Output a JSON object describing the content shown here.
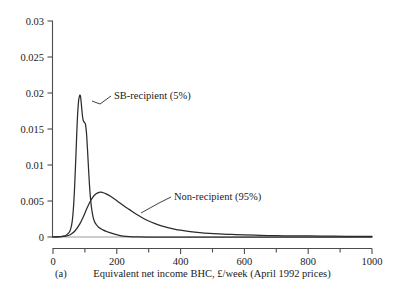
{
  "chart_data": {
    "type": "line",
    "title": "",
    "subtitle": "",
    "xlabel": "Equivalent net income BHC, £/week (April 1992 prices)",
    "ylabel": "",
    "panel_label": "(a)",
    "xlim": [
      0,
      1000
    ],
    "ylim": [
      0,
      0.03
    ],
    "grid": false,
    "legend_position": "inline-annotations",
    "x_ticks": [
      0,
      200,
      400,
      600,
      800,
      1000
    ],
    "x_tick_labels": [
      "0",
      "200",
      "400",
      "600",
      "800",
      "1000"
    ],
    "x_minor_ticks": [
      100,
      300,
      500,
      700,
      900
    ],
    "y_ticks": [
      0,
      0.005,
      0.01,
      0.015,
      0.02,
      0.025,
      0.03
    ],
    "y_tick_labels": [
      "0",
      "0.005",
      "0.01",
      "0.015",
      "0.02",
      "0.025",
      "0.03"
    ],
    "annotations": [
      {
        "text": "SB-recipient (5%)",
        "x": 145,
        "y": 0.0203
      },
      {
        "text": "Non-recipient (95%)",
        "x": 330,
        "y": 0.0063
      }
    ],
    "series": [
      {
        "name": "SB-recipient (5%)",
        "label": "SB-recipient (5%)",
        "color": "#2b2b2b",
        "peak_x": 85,
        "peak_y": 0.0197,
        "x": [
          0,
          10,
          20,
          30,
          40,
          50,
          55,
          60,
          64,
          68,
          72,
          76,
          80,
          83,
          85,
          87,
          90,
          93,
          96,
          99,
          102,
          105,
          108,
          112,
          116,
          120,
          125,
          130,
          136,
          142,
          150,
          158,
          168,
          178,
          190,
          205,
          220,
          240,
          260,
          300,
          400,
          600,
          800,
          1000
        ],
        "y": [
          0.0,
          2e-05,
          5e-05,
          0.0001,
          0.00022,
          0.0006,
          0.00105,
          0.0021,
          0.004,
          0.0072,
          0.0115,
          0.016,
          0.0188,
          0.01955,
          0.0197,
          0.0193,
          0.0179,
          0.0166,
          0.01605,
          0.0159,
          0.0156,
          0.0144,
          0.0123,
          0.009,
          0.0062,
          0.0043,
          0.0029,
          0.00215,
          0.0017,
          0.0014,
          0.00115,
          0.00095,
          0.00076,
          0.0006,
          0.00044,
          0.00026,
          0.00012,
          4e-05,
          1e-05,
          0.0,
          0.0,
          0.0,
          0.0,
          0.0
        ]
      },
      {
        "name": "Non-recipient (95%)",
        "label": "Non-recipient (95%)",
        "color": "#2b2b2b",
        "peak_x": 150,
        "peak_y": 0.0062,
        "x": [
          0,
          20,
          40,
          55,
          70,
          85,
          95,
          105,
          115,
          125,
          135,
          145,
          150,
          158,
          168,
          180,
          195,
          210,
          225,
          240,
          260,
          280,
          300,
          320,
          340,
          360,
          380,
          400,
          430,
          460,
          490,
          520,
          560,
          600,
          650,
          700,
          750,
          800,
          860,
          920,
          1000
        ],
        "y": [
          0.0,
          3e-05,
          0.00012,
          0.00035,
          0.0009,
          0.0019,
          0.0028,
          0.00385,
          0.0048,
          0.00555,
          0.006,
          0.0062,
          0.00622,
          0.00615,
          0.00595,
          0.00565,
          0.0052,
          0.00472,
          0.00425,
          0.0038,
          0.0032,
          0.00268,
          0.00222,
          0.00185,
          0.00154,
          0.0013,
          0.0011,
          0.00094,
          0.00076,
          0.00062,
          0.00051,
          0.00043,
          0.00035,
          0.00029,
          0.00023,
          0.00019,
          0.00016,
          0.00014,
          0.00012,
          0.0001,
          8e-05
        ]
      }
    ],
    "baseline": {
      "color": "#999999",
      "description": "zero reference line along x-axis"
    }
  }
}
